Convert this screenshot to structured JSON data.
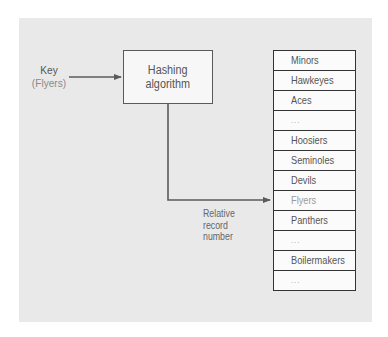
{
  "diagram": {
    "key": {
      "label": "Key",
      "value": "(Flyers)"
    },
    "hash_box": {
      "line1": "Hashing",
      "line2": "algorithm"
    },
    "output_label": {
      "line1": "Relative",
      "line2": "record",
      "line3": "number"
    },
    "records": [
      {
        "label": "Minors",
        "highlight": false
      },
      {
        "label": "Hawkeyes",
        "highlight": false
      },
      {
        "label": "Aces",
        "highlight": false
      },
      {
        "label": "...",
        "highlight": false
      },
      {
        "label": "Hoosiers",
        "highlight": false
      },
      {
        "label": "Seminoles",
        "highlight": false
      },
      {
        "label": "Devils",
        "highlight": false
      },
      {
        "label": "Flyers",
        "highlight": true
      },
      {
        "label": "Panthers",
        "highlight": false
      },
      {
        "label": "...",
        "highlight": false
      },
      {
        "label": "Boilermakers",
        "highlight": false
      },
      {
        "label": "...",
        "highlight": false
      }
    ],
    "colors": {
      "panel_bg": "#e9e9e9",
      "line": "#5a5a5a",
      "text": "#555555",
      "highlight_text": "#9a9a9a"
    }
  }
}
